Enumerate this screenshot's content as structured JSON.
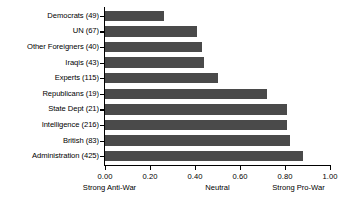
{
  "chart_data": {
    "type": "bar",
    "orientation": "horizontal",
    "title": "",
    "xlabel": "",
    "ylabel": "",
    "xlim": [
      0.0,
      1.0
    ],
    "grid": false,
    "legend": false,
    "bar_color": "#4a4a4a",
    "axis_color": "#000000",
    "categories": [
      "Democrats (49)",
      "UN (67)",
      "Other Foreigners (40)",
      "Iraqis (43)",
      "Experts (115)",
      "Republicans (19)",
      "State Dept (21)",
      "Intelligence (216)",
      "British (83)",
      "Administration (425)"
    ],
    "values": [
      0.26,
      0.41,
      0.43,
      0.44,
      0.5,
      0.72,
      0.81,
      0.81,
      0.82,
      0.88
    ],
    "xticks": [
      0.0,
      0.2,
      0.4,
      0.6,
      0.8,
      1.0
    ],
    "xtick_labels": [
      "0.00",
      "0.20",
      "0.40",
      "0.60",
      "0.80",
      "1.00"
    ],
    "anchors": [
      {
        "label": "Strong Anti-War",
        "at": 0.02
      },
      {
        "label": "Neutral",
        "at": 0.5
      },
      {
        "label": "Strong Pro-War",
        "at": 0.86
      }
    ]
  }
}
